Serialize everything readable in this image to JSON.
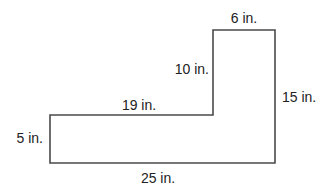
{
  "diagram": {
    "type": "composite-rectangle",
    "shape": "L-shape",
    "stroke_color": "#4a4a4a",
    "text_color": "#222222",
    "labels": {
      "top_width": "6 in.",
      "inner_vertical": "10 in.",
      "right_height": "15 in.",
      "inner_horizontal": "19 in.",
      "left_height": "5 in.",
      "bottom_width": "25 in."
    },
    "dimensions": [
      {
        "side": "top",
        "value": 6,
        "unit": "in."
      },
      {
        "side": "inner-vertical",
        "value": 10,
        "unit": "in."
      },
      {
        "side": "right",
        "value": 15,
        "unit": "in."
      },
      {
        "side": "inner-horizontal",
        "value": 19,
        "unit": "in."
      },
      {
        "side": "left",
        "value": 5,
        "unit": "in."
      },
      {
        "side": "bottom",
        "value": 25,
        "unit": "in."
      }
    ]
  }
}
